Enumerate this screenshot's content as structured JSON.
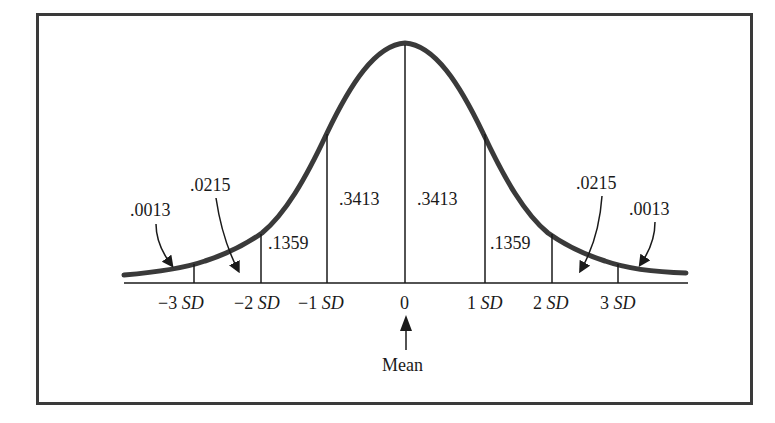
{
  "figure": {
    "mean_label": "Mean"
  },
  "areas": {
    "left_tail_3": ".0013",
    "left_2_3": ".0215",
    "left_1_2": ".1359",
    "left_0_1": ".3413",
    "right_0_1": ".3413",
    "right_1_2": ".1359",
    "right_2_3": ".0215",
    "right_tail_3": ".0013"
  },
  "axis": {
    "ticks": [
      {
        "num": "−3",
        "unit": "SD"
      },
      {
        "num": "−2",
        "unit": "SD"
      },
      {
        "num": "−1",
        "unit": "SD"
      },
      {
        "num": "0",
        "unit": ""
      },
      {
        "num": "1",
        "unit": "SD"
      },
      {
        "num": "2",
        "unit": "SD"
      },
      {
        "num": "3",
        "unit": "SD"
      }
    ]
  },
  "colors": {
    "curve": "#3a3a3a",
    "frame": "#3a3a3a",
    "lines": "#1a1a1a"
  }
}
